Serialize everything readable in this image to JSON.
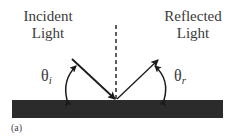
{
  "diagram": {
    "incident_label_line1": "Incident",
    "incident_label_line2": "Light",
    "reflected_label_line1": "Reflected",
    "reflected_label_line2": "Light",
    "theta_i_symbol": "θ",
    "theta_i_subscript": "i",
    "theta_r_symbol": "θ",
    "theta_r_subscript": "r",
    "caption": "(a)",
    "colors": {
      "surface": "#2b2b2b",
      "lines": "#1a1a1a",
      "text": "#3a3a3a"
    }
  }
}
